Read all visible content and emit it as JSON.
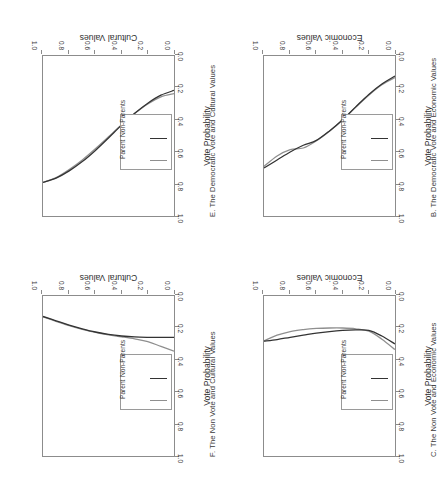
{
  "figure": {
    "orientation": "rotated-180",
    "series_colors": {
      "parent": "#8f8f8f",
      "non_parents": "#333333"
    },
    "axis_color": "#8c8c8c"
  },
  "legend": {
    "items": [
      {
        "label": "Parent",
        "color": "#8f8f8f"
      },
      {
        "label": "Non-Parents",
        "color": "#333333"
      }
    ]
  },
  "axes": {
    "y_title": "Vote Probability",
    "y_ticks": [
      "0.0",
      "0.2",
      "0.4",
      "0.6",
      "0.8",
      "1.0"
    ],
    "x_ticks": [
      "0.0",
      "0.2",
      "0.4",
      "0.6",
      "0.8",
      "1.0"
    ],
    "x_title_economic": "Economic Values",
    "x_title_cultural": "Cultural Values"
  },
  "panels": {
    "b": {
      "title": "B. The Democratic Vote and Economic Values"
    },
    "c": {
      "title": "C. The Non Vote and Economic Values"
    },
    "e": {
      "title": "E. The Democratic Vote and Cultural Values"
    },
    "f": {
      "title": "F. The Non Vote and Cultural Values"
    }
  },
  "chart_data": [
    {
      "id": "B",
      "type": "line",
      "title": "B. The Democratic Vote and Economic Values",
      "xlabel": "Economic Values",
      "ylabel": "Vote Probability",
      "xlim": [
        0,
        1
      ],
      "ylim": [
        0,
        1
      ],
      "grid": false,
      "legend_position": "left-middle",
      "x": [
        0.0,
        0.1,
        0.2,
        0.3,
        0.4,
        0.5,
        0.6,
        0.7,
        0.8,
        0.9,
        1.0
      ],
      "series": [
        {
          "name": "Parent",
          "values": [
            0.135,
            0.18,
            0.245,
            0.32,
            0.4,
            0.47,
            0.53,
            0.575,
            0.585,
            0.625,
            0.69
          ]
        },
        {
          "name": "Non-Parents",
          "values": [
            0.125,
            0.175,
            0.24,
            0.318,
            0.398,
            0.468,
            0.527,
            0.558,
            0.6,
            0.65,
            0.7
          ]
        }
      ]
    },
    {
      "id": "C",
      "type": "line",
      "title": "C. The Non Vote and Economic Values",
      "xlabel": "Economic Values",
      "ylabel": "Vote Probability",
      "xlim": [
        0,
        1
      ],
      "ylim": [
        0,
        1
      ],
      "grid": false,
      "legend_position": "left-middle",
      "x": [
        0.0,
        0.1,
        0.2,
        0.3,
        0.4,
        0.5,
        0.6,
        0.7,
        0.8,
        0.9,
        1.0
      ],
      "series": [
        {
          "name": "Parent",
          "values": [
            0.335,
            0.27,
            0.22,
            0.205,
            0.2,
            0.2,
            0.203,
            0.21,
            0.222,
            0.245,
            0.28
          ]
        },
        {
          "name": "Non-Parents",
          "values": [
            0.3,
            0.25,
            0.215,
            0.212,
            0.215,
            0.222,
            0.232,
            0.245,
            0.258,
            0.272,
            0.282
          ]
        }
      ]
    },
    {
      "id": "E",
      "type": "line",
      "title": "E. The Democratic Vote and Cultural Values",
      "xlabel": "Cultural Values",
      "ylabel": "Vote Probability",
      "xlim": [
        0,
        1
      ],
      "ylim": [
        0,
        1
      ],
      "grid": false,
      "legend_position": "left-middle",
      "x": [
        0.0,
        0.1,
        0.2,
        0.3,
        0.4,
        0.5,
        0.6,
        0.7,
        0.8,
        0.9,
        1.0
      ],
      "series": [
        {
          "name": "Parent",
          "values": [
            0.235,
            0.255,
            0.3,
            0.36,
            0.43,
            0.505,
            0.58,
            0.65,
            0.71,
            0.76,
            0.79
          ]
        },
        {
          "name": "Non-Parents",
          "values": [
            0.215,
            0.245,
            0.295,
            0.358,
            0.432,
            0.512,
            0.59,
            0.66,
            0.718,
            0.763,
            0.79
          ]
        }
      ]
    },
    {
      "id": "F",
      "type": "line",
      "title": "F. The Non Vote and Cultural Values",
      "xlabel": "Cultural Values",
      "ylabel": "Vote Probability",
      "xlim": [
        0,
        1
      ],
      "ylim": [
        0,
        1
      ],
      "grid": false,
      "legend_position": "left-middle",
      "x": [
        0.0,
        0.1,
        0.2,
        0.3,
        0.4,
        0.5,
        0.6,
        0.7,
        0.8,
        0.9,
        1.0
      ],
      "series": [
        {
          "name": "Parent",
          "values": [
            0.345,
            0.315,
            0.285,
            0.268,
            0.255,
            0.243,
            0.228,
            0.208,
            0.185,
            0.158,
            0.13
          ]
        },
        {
          "name": "Non-Parents",
          "values": [
            0.258,
            0.258,
            0.258,
            0.256,
            0.25,
            0.24,
            0.225,
            0.205,
            0.182,
            0.155,
            0.128
          ]
        }
      ]
    }
  ]
}
